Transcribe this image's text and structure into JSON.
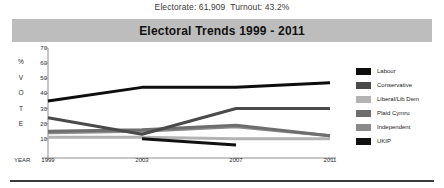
{
  "header": {
    "summary": "Electorate: 61,909  Turnout: 43.2%"
  },
  "title_bar": {
    "title": "Electoral Trends 1999 - 2011",
    "background": "#bdbdbd"
  },
  "axis": {
    "y_letters": [
      "%",
      "V",
      "O",
      "T",
      "E"
    ],
    "y_ticks": [
      70,
      60,
      50,
      40,
      30,
      20,
      10
    ],
    "x_word": "YEAR"
  },
  "legend": {
    "items": [
      {
        "label": "Labour",
        "color": "#0d0d0d"
      },
      {
        "label": "Conservative",
        "color": "#4a4a4a"
      },
      {
        "label": "Liberal/Lib Dem",
        "color": "#b3b3b3"
      },
      {
        "label": "Plaid Cymru",
        "color": "#6e6e6e"
      },
      {
        "label": "Independent",
        "color": "#8a8a8a"
      },
      {
        "label": "UKIP",
        "color": "#111111"
      }
    ]
  },
  "chart_data": {
    "type": "line",
    "title": "Electoral Trends 1999 - 2011",
    "xlabel": "YEAR",
    "ylabel": "% VOTE",
    "x": [
      1999,
      2003,
      2007,
      2011
    ],
    "categories": [
      "1999",
      "2003",
      "2007",
      "2011"
    ],
    "ylim": [
      0,
      70
    ],
    "yticks": [
      10,
      20,
      30,
      40,
      50,
      60,
      70
    ],
    "grid": false,
    "legend_position": "right",
    "series": [
      {
        "name": "Labour",
        "color": "#0d0d0d",
        "x": [
          1999,
          2003,
          2007,
          2011
        ],
        "values": [
          35,
          44,
          44,
          47
        ]
      },
      {
        "name": "Conservative",
        "color": "#4a4a4a",
        "x": [
          1999,
          2003,
          2007,
          2011
        ],
        "values": [
          24,
          13,
          30,
          30
        ]
      },
      {
        "name": "Liberal/Lib Dem",
        "color": "#b3b3b3",
        "x": [
          1999,
          2003,
          2007,
          2011
        ],
        "values": [
          11,
          11,
          10,
          10
        ]
      },
      {
        "name": "Plaid Cymru",
        "color": "#6e6e6e",
        "x": [
          1999,
          2003,
          2007,
          2011
        ],
        "values": [
          15,
          16,
          19,
          12
        ]
      },
      {
        "name": "Independent",
        "color": "#8a8a8a",
        "x": [
          1999,
          2003,
          2007,
          2011
        ],
        "values": [
          14,
          15,
          18,
          12
        ]
      },
      {
        "name": "UKIP",
        "color": "#111111",
        "x": [
          2003,
          2007
        ],
        "values": [
          10,
          6
        ]
      }
    ]
  }
}
